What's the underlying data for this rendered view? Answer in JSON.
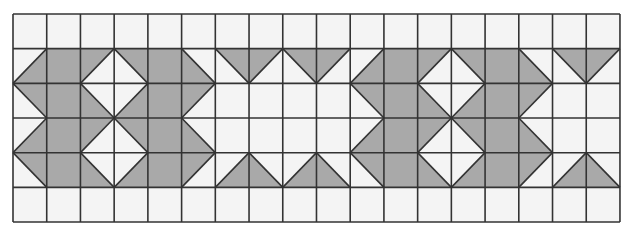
{
  "diagram": {
    "columns": 18,
    "rows": 6,
    "origin": [
      13,
      14
    ],
    "cell_width": 33.72,
    "cell_height": 34.67,
    "colors": {
      "background": "#ffffff",
      "cell_fill": "#f4f4f4",
      "shade": "#a9a9a9",
      "line": "#333333"
    },
    "legend": {
      "w": "white cell",
      "g": "fully shaded cell",
      "tl": "half-shaded triangle, top-left corner",
      "tr": "half-shaded triangle, top-right corner",
      "bl": "half-shaded triangle, bottom-left corner",
      "br": "half-shaded triangle, bottom-right corner"
    },
    "cells": [
      [
        "w",
        "w",
        "w",
        "w",
        "w",
        "w",
        "w",
        "w",
        "w",
        "w",
        "w",
        "w",
        "w",
        "w",
        "w",
        "w",
        "w",
        "w"
      ],
      [
        "br",
        "g",
        "tl",
        "tr",
        "g",
        "bl",
        "tr",
        "tl",
        "tr",
        "tl",
        "br",
        "g",
        "tl",
        "tr",
        "g",
        "bl",
        "tr",
        "tl"
      ],
      [
        "tr",
        "g",
        "bl",
        "br",
        "g",
        "tl",
        "w",
        "w",
        "w",
        "w",
        "tr",
        "g",
        "bl",
        "br",
        "g",
        "tl",
        "w",
        "w"
      ],
      [
        "br",
        "g",
        "tl",
        "tr",
        "g",
        "bl",
        "w",
        "w",
        "w",
        "w",
        "br",
        "g",
        "tl",
        "tr",
        "g",
        "bl",
        "w",
        "w"
      ],
      [
        "tr",
        "g",
        "bl",
        "br",
        "g",
        "tl",
        "br",
        "bl",
        "br",
        "bl",
        "tr",
        "g",
        "bl",
        "br",
        "g",
        "tl",
        "br",
        "bl"
      ],
      [
        "w",
        "w",
        "w",
        "w",
        "w",
        "w",
        "w",
        "w",
        "w",
        "w",
        "w",
        "w",
        "w",
        "w",
        "w",
        "w",
        "w",
        "w"
      ]
    ]
  }
}
